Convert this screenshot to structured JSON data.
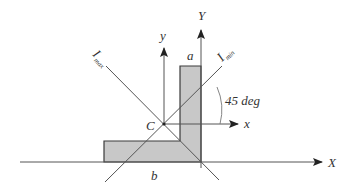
{
  "diagram": {
    "type": "L-section principal axes",
    "labels": {
      "Y_axis": "Y",
      "X_axis": "X",
      "y_axis": "y",
      "x_axis": "x",
      "centroid": "C",
      "a_dim": "a",
      "b_dim": "b",
      "I_max_main": "I",
      "I_max_sub": "max",
      "I_min_main": "I",
      "I_min_sub": "min",
      "angle": "45 deg"
    },
    "colors": {
      "line": "#3a3a3a",
      "fill": "#c8c8c8",
      "text": "#333333"
    }
  }
}
